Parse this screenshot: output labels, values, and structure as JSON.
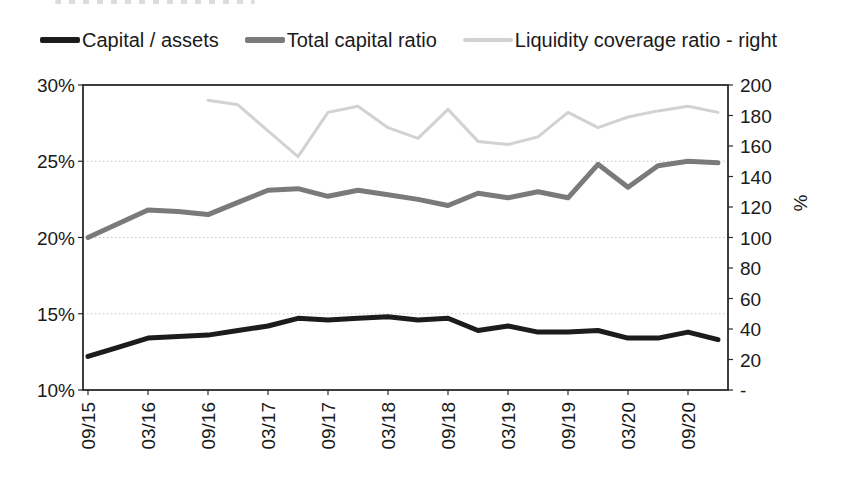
{
  "colors": {
    "background": "#ffffff",
    "gridline": "#c6c6c6",
    "plot_border": "#2a2a2a",
    "text": "#1a1a1a"
  },
  "chart_data": {
    "type": "line",
    "legend_position": "top",
    "grid": "horizontal-dotted",
    "categories": [
      "09/15",
      "12/15",
      "03/16",
      "06/16",
      "09/16",
      "12/16",
      "03/17",
      "06/17",
      "09/17",
      "12/17",
      "03/18",
      "06/18",
      "09/18",
      "12/18",
      "03/19",
      "06/19",
      "09/19",
      "12/19",
      "03/20",
      "06/20",
      "09/20",
      "12/20"
    ],
    "x_tick_labels": [
      {
        "label": "09/15",
        "index": 0
      },
      {
        "label": "03/16",
        "index": 2
      },
      {
        "label": "09/16",
        "index": 4
      },
      {
        "label": "03/17",
        "index": 6
      },
      {
        "label": "09/17",
        "index": 8
      },
      {
        "label": "03/18",
        "index": 10
      },
      {
        "label": "09/18",
        "index": 12
      },
      {
        "label": "03/19",
        "index": 14
      },
      {
        "label": "09/19",
        "index": 16
      },
      {
        "label": "03/20",
        "index": 18
      },
      {
        "label": "09/20",
        "index": 20
      }
    ],
    "series": [
      {
        "name": "Capital / assets",
        "axis": "left",
        "color": "#1c1c1c",
        "stroke_width": 5,
        "values": [
          12.2,
          12.8,
          13.4,
          13.5,
          13.6,
          13.9,
          14.2,
          14.7,
          14.6,
          14.7,
          14.8,
          14.6,
          14.7,
          13.9,
          14.2,
          13.8,
          13.8,
          13.9,
          13.4,
          13.4,
          13.8,
          13.3
        ]
      },
      {
        "name": "Total capital ratio",
        "axis": "left",
        "color": "#7a7a7a",
        "stroke_width": 5,
        "values": [
          20.0,
          20.9,
          21.8,
          21.7,
          21.5,
          22.3,
          23.1,
          23.2,
          22.7,
          23.1,
          22.8,
          22.5,
          22.1,
          22.9,
          22.6,
          23.0,
          22.6,
          24.8,
          23.3,
          24.7,
          25.0,
          24.9
        ]
      },
      {
        "name": "Liquidity coverage ratio - right",
        "axis": "right",
        "color": "#d2d2d2",
        "stroke_width": 3,
        "values": [
          null,
          null,
          null,
          null,
          190,
          187,
          170,
          153,
          182,
          186,
          172,
          165,
          184,
          163,
          161,
          166,
          182,
          172,
          179,
          183,
          186,
          182
        ]
      }
    ],
    "left_axis": {
      "min": 10,
      "max": 30,
      "ticks": [
        {
          "label": "30%",
          "value": 30
        },
        {
          "label": "25%",
          "value": 25
        },
        {
          "label": "20%",
          "value": 20
        },
        {
          "label": "15%",
          "value": 15
        },
        {
          "label": "10%",
          "value": 10
        }
      ],
      "gridline_values": [
        25,
        20,
        15
      ]
    },
    "right_axis": {
      "min": 0,
      "max": 200,
      "title": "%",
      "ticks": [
        {
          "label": "200",
          "value": 200
        },
        {
          "label": "180",
          "value": 180
        },
        {
          "label": "160",
          "value": 160
        },
        {
          "label": "140",
          "value": 140
        },
        {
          "label": "120",
          "value": 120
        },
        {
          "label": "100",
          "value": 100
        },
        {
          "label": "80",
          "value": 80
        },
        {
          "label": "60",
          "value": 60
        },
        {
          "label": "40",
          "value": 40
        },
        {
          "label": "20",
          "value": 20
        },
        {
          "label": "-",
          "value": 0
        }
      ]
    }
  }
}
